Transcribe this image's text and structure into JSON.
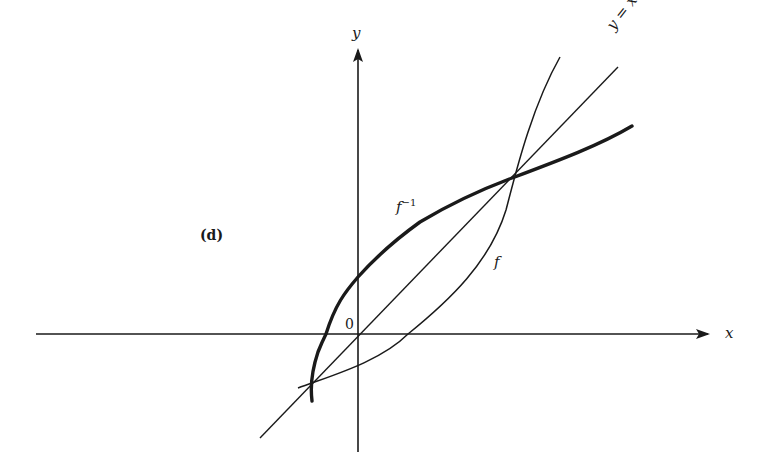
{
  "figure": {
    "panel_label": "(d)",
    "colors": {
      "ink": "#1a1a1a",
      "background": "#ffffff"
    },
    "axes": {
      "x_label": "x",
      "y_label": "y",
      "origin_label": "0"
    },
    "curves": [
      {
        "id": "f",
        "label": "f",
        "style": "thin"
      },
      {
        "id": "f_inverse",
        "label_base": "f",
        "label_sup": "−1",
        "style": "thick"
      },
      {
        "id": "identity",
        "label": "y = x",
        "style": "thin line"
      }
    ],
    "intersections": [
      "lower-left (below origin)",
      "upper-right (on y = x)"
    ]
  }
}
